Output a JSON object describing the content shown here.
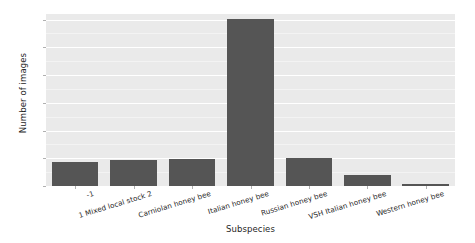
{
  "chart_data": {
    "type": "bar",
    "title": "",
    "xlabel": "Subspecies",
    "ylabel": "Number of images",
    "categories": [
      "-1",
      "1 Mixed local stock 2",
      "Carniolan honey bee",
      "Italian honey bee",
      "Russian honey bee",
      "VSH Italian honey bee",
      "Western honey bee"
    ],
    "values": [
      440,
      470,
      480,
      3010,
      510,
      200,
      40
    ],
    "ylim": [
      0,
      3100
    ],
    "yticks": [
      0,
      500,
      1000,
      1500,
      2000,
      2500,
      3000
    ],
    "ytick_labels": [
      "0",
      "500",
      "1000",
      "1500",
      "2000",
      "2500",
      "3000"
    ],
    "grid": true,
    "legend": "none",
    "bar_color": "#555555",
    "plot_background": "#eaeaea",
    "grid_color": "#ffffff",
    "figure_background": "#ffffff"
  }
}
